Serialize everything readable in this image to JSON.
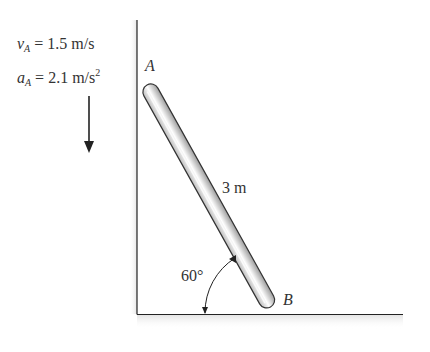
{
  "diagram": {
    "given": {
      "velocity": {
        "symbol": "v",
        "subscript": "A",
        "equals": "=",
        "value": "1.5 m/s"
      },
      "acceleration": {
        "symbol": "a",
        "subscript": "A",
        "equals": "=",
        "value": "2.1 m/s",
        "exponent": "2"
      }
    },
    "points": {
      "A": "A",
      "B": "B"
    },
    "rod_length_label": "3 m",
    "angle_label": "60°",
    "colors": {
      "line": "#222222",
      "rod_fill": "#e6e6e6",
      "rod_highlight": "#ffffff",
      "text": "#333333",
      "shadow": "#ececec"
    }
  }
}
